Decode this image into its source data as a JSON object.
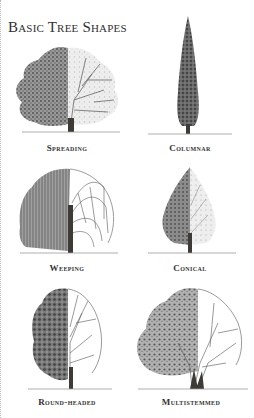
{
  "title": "Basic Tree Shapes",
  "trees": [
    {
      "label": "Spreading"
    },
    {
      "label": "Columnar"
    },
    {
      "label": "Weeping"
    },
    {
      "label": "Conical"
    },
    {
      "label": "Round-headed"
    },
    {
      "label": "Multistemmed"
    }
  ],
  "colors": {
    "foliage_dark": "#5a5a5a",
    "foliage_mid": "#8a8a8a",
    "foliage_light": "#c4c4c4",
    "trunk": "#3e3a36",
    "ground": "#9a9a9a"
  }
}
